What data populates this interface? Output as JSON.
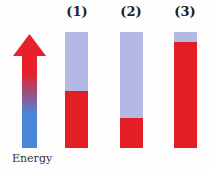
{
  "arrow": {
    "label": "Energy",
    "top_color": "#e8202a",
    "bottom_color": "#4a86d8"
  },
  "colors": {
    "empty": "#b4b8e4",
    "filled": "#e31e24"
  },
  "bars": [
    {
      "label": "(1)",
      "fill_fraction": 0.49
    },
    {
      "label": "(2)",
      "fill_fraction": 0.26
    },
    {
      "label": "(3)",
      "fill_fraction": 0.91
    }
  ]
}
